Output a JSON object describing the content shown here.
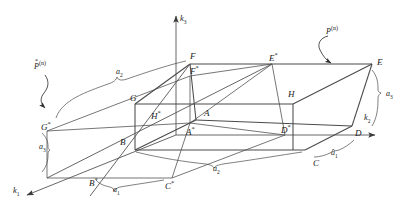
{
  "figure": {
    "type": "3d-unit-cell-diagram",
    "line_color": "#4a4a4a",
    "text_color": "#1a1a1a",
    "background": "#ffffff"
  },
  "axes": [
    {
      "name": "k1",
      "base": "k",
      "sub": "1",
      "label": "k₁",
      "direction": "down-left"
    },
    {
      "name": "k2",
      "base": "k",
      "sub": "2",
      "label": "k₂",
      "direction": "right"
    },
    {
      "name": "k3",
      "base": "k",
      "sub": "3",
      "label": "k₃",
      "direction": "up"
    }
  ],
  "vertices": [
    {
      "id": "A",
      "base": "A",
      "star": "",
      "x": 204,
      "y": 114
    },
    {
      "id": "As",
      "base": "A",
      "star": "*",
      "x": 186,
      "y": 131
    },
    {
      "id": "B",
      "base": "B",
      "star": "",
      "x": 120,
      "y": 143
    },
    {
      "id": "Bs",
      "base": "B",
      "star": "*",
      "x": 89,
      "y": 182
    },
    {
      "id": "C",
      "base": "C",
      "star": "",
      "x": 313,
      "y": 164
    },
    {
      "id": "Cs",
      "base": "C",
      "star": "*",
      "x": 165,
      "y": 185
    },
    {
      "id": "D",
      "base": "D",
      "star": "",
      "x": 355,
      "y": 134
    },
    {
      "id": "Ds",
      "base": "D",
      "star": "*",
      "x": 281,
      "y": 129
    },
    {
      "id": "E",
      "base": "E",
      "star": "",
      "x": 377,
      "y": 63
    },
    {
      "id": "Es",
      "base": "E",
      "star": "*",
      "x": 269,
      "y": 57
    },
    {
      "id": "F",
      "base": "F",
      "star": "",
      "x": 190,
      "y": 57
    },
    {
      "id": "Fs",
      "base": "F",
      "star": "*",
      "x": 190,
      "y": 70
    },
    {
      "id": "G",
      "base": "G",
      "star": "",
      "x": 130,
      "y": 99
    },
    {
      "id": "Gs",
      "base": "G",
      "star": "*",
      "x": 41,
      "y": 126
    },
    {
      "id": "H",
      "base": "H",
      "star": "",
      "x": 288,
      "y": 95
    },
    {
      "id": "Hs",
      "base": "H",
      "star": "*",
      "x": 151,
      "y": 115
    }
  ],
  "cell_dimensions": [
    {
      "id": "a1-bottom-left",
      "base": "a",
      "sub": "1",
      "label": "a₁",
      "x": 113,
      "y": 190
    },
    {
      "id": "a1-bottom-right",
      "base": "a",
      "sub": "1",
      "label": "a₁",
      "x": 331,
      "y": 153
    },
    {
      "id": "a2-top-left",
      "base": "a",
      "sub": "2",
      "label": "a₂",
      "x": 116,
      "y": 72
    },
    {
      "id": "a2-bottom-mid",
      "base": "a",
      "sub": "2",
      "label": "a₂",
      "x": 213,
      "y": 169
    },
    {
      "id": "a3-left",
      "base": "a",
      "sub": "3",
      "label": "a₃",
      "x": 43,
      "y": 147
    },
    {
      "id": "a3-right",
      "base": "a",
      "sub": "3",
      "label": "a₃",
      "x": 387,
      "y": 94
    }
  ],
  "plane_labels": [
    {
      "id": "P-star-n",
      "base": "P",
      "starred": true,
      "sup": "(n)",
      "text": "P*(n)",
      "x": 35,
      "y": 64,
      "points_to": "Gs"
    },
    {
      "id": "P-n",
      "base": "P",
      "starred": false,
      "sup": "(n)",
      "text": "P(n)",
      "x": 326,
      "y": 29,
      "points_to": "E-face"
    }
  ]
}
